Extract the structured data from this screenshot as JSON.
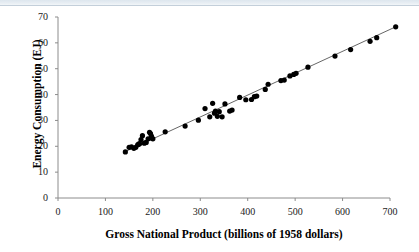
{
  "chart_data": {
    "type": "scatter",
    "title": "",
    "subtitle": "",
    "xlabel": "Gross National Product (billions of 1958 dollars)",
    "ylabel": "Energy Consumption (EJ)",
    "xlim": [
      0,
      700
    ],
    "ylim": [
      0,
      70
    ],
    "xticks": [
      0,
      100,
      200,
      300,
      400,
      500,
      600,
      700
    ],
    "yticks": [
      0,
      10,
      20,
      30,
      40,
      50,
      60,
      70
    ],
    "grid": false,
    "legend": "none",
    "marker": {
      "shape": "circle",
      "color": "#000000",
      "size": 4
    },
    "trendline": {
      "present": true,
      "color": "#555555",
      "style": "solid",
      "x_start": 140,
      "y_start": 17.8,
      "x_end": 712,
      "y_end": 66.2
    },
    "series": [
      {
        "name": "Energy Consumption vs GNP",
        "points": [
          [
            142,
            17.8
          ],
          [
            150,
            19.6
          ],
          [
            155,
            19.8
          ],
          [
            160,
            19.2
          ],
          [
            164,
            19.6
          ],
          [
            168,
            20.6
          ],
          [
            170,
            20.8
          ],
          [
            172,
            21.0
          ],
          [
            175,
            22.6
          ],
          [
            178,
            24.1
          ],
          [
            182,
            21.2
          ],
          [
            186,
            21.5
          ],
          [
            190,
            22.9
          ],
          [
            193,
            25.4
          ],
          [
            195,
            24.9
          ],
          [
            197,
            23.9
          ],
          [
            198,
            23.2
          ],
          [
            200,
            22.9
          ],
          [
            226,
            25.6
          ],
          [
            268,
            27.8
          ],
          [
            296,
            30.1
          ],
          [
            310,
            34.6
          ],
          [
            320,
            31.4
          ],
          [
            326,
            36.6
          ],
          [
            330,
            32.8
          ],
          [
            332,
            33.6
          ],
          [
            336,
            31.6
          ],
          [
            340,
            33.4
          ],
          [
            346,
            31.4
          ],
          [
            352,
            36.4
          ],
          [
            362,
            33.6
          ],
          [
            367,
            34.0
          ],
          [
            383,
            38.9
          ],
          [
            396,
            38.0
          ],
          [
            408,
            38.1
          ],
          [
            414,
            39.2
          ],
          [
            419,
            39.4
          ],
          [
            437,
            42.0
          ],
          [
            443,
            44.0
          ],
          [
            470,
            45.4
          ],
          [
            477,
            45.6
          ],
          [
            489,
            47.2
          ],
          [
            497,
            47.8
          ],
          [
            502,
            48.2
          ],
          [
            527,
            50.6
          ],
          [
            584,
            54.9
          ],
          [
            617,
            57.4
          ],
          [
            658,
            60.6
          ],
          [
            672,
            62.0
          ],
          [
            712,
            66.2
          ]
        ]
      }
    ]
  },
  "axes": {
    "x_tick_labels": [
      "0",
      "100",
      "200",
      "300",
      "400",
      "500",
      "600",
      "700"
    ],
    "y_tick_labels": [
      "0",
      "10",
      "20",
      "30",
      "40",
      "50",
      "60",
      "70"
    ],
    "x_title": "Gross National Product (billions of 1958 dollars)",
    "y_title": "Energy Consumption (EJ)"
  }
}
